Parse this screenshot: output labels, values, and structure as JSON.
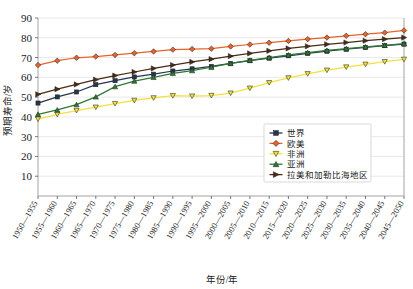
{
  "chart_data": {
    "type": "line",
    "title": "",
    "xlabel": "年份/年",
    "ylabel": "预期寿命/岁",
    "ylim": [
      0,
      90
    ],
    "yticks": [
      10,
      20,
      30,
      40,
      50,
      60,
      70,
      80,
      90
    ],
    "grid": true,
    "legend_position": "inside-lower-right",
    "categories": [
      "1950—1955",
      "1955—1960",
      "1960—1965",
      "1965—1970",
      "1970—1975",
      "1975—1980",
      "1980—1985",
      "1985—1990",
      "1990—1995",
      "1995—2000",
      "2000—2005",
      "2005—2010",
      "2010—2015",
      "2015—2020",
      "2020—2025",
      "2025—2030",
      "2030—2035",
      "2035—2040",
      "2040—2045",
      "2045—2050"
    ],
    "series": [
      {
        "name": "世界",
        "color": "#27364f",
        "marker": "square",
        "values": [
          47.0,
          50.1,
          52.6,
          56.3,
          58.3,
          60.2,
          61.6,
          63.2,
          64.3,
          65.5,
          67.0,
          68.4,
          69.7,
          70.9,
          72.1,
          73.2,
          74.2,
          75.1,
          76.0,
          76.8
        ]
      },
      {
        "name": "欧美",
        "color": "#e8622a",
        "marker": "diamond",
        "values": [
          66.2,
          68.4,
          69.9,
          70.5,
          71.3,
          72.2,
          73.1,
          74.0,
          74.3,
          74.5,
          75.6,
          76.6,
          77.5,
          78.4,
          79.3,
          80.1,
          81.0,
          81.8,
          82.6,
          83.7
        ]
      },
      {
        "name": "非洲",
        "color": "#f2e13a",
        "marker": "triangle-down",
        "values": [
          38.9,
          41.3,
          43.2,
          44.9,
          46.7,
          48.3,
          49.6,
          50.7,
          50.5,
          50.8,
          52.0,
          54.5,
          57.3,
          59.7,
          61.8,
          63.6,
          65.2,
          66.6,
          67.9,
          69.1
        ]
      },
      {
        "name": "亚洲",
        "color": "#2e7a33",
        "marker": "triangle-up",
        "values": [
          41.3,
          43.5,
          46.2,
          50.1,
          55.3,
          58.1,
          60.0,
          62.0,
          63.4,
          65.1,
          67.0,
          68.6,
          70.0,
          71.3,
          72.5,
          73.6,
          74.5,
          75.4,
          76.2,
          77.0
        ]
      },
      {
        "name": "拉美和加勒比海地区",
        "color": "#4a2b14",
        "marker": "triangle-right",
        "values": [
          51.4,
          54.0,
          56.4,
          58.8,
          60.9,
          62.7,
          64.5,
          66.2,
          67.8,
          69.2,
          70.7,
          72.1,
          73.4,
          74.6,
          75.7,
          76.7,
          77.6,
          78.5,
          79.3,
          80.1
        ]
      }
    ]
  }
}
